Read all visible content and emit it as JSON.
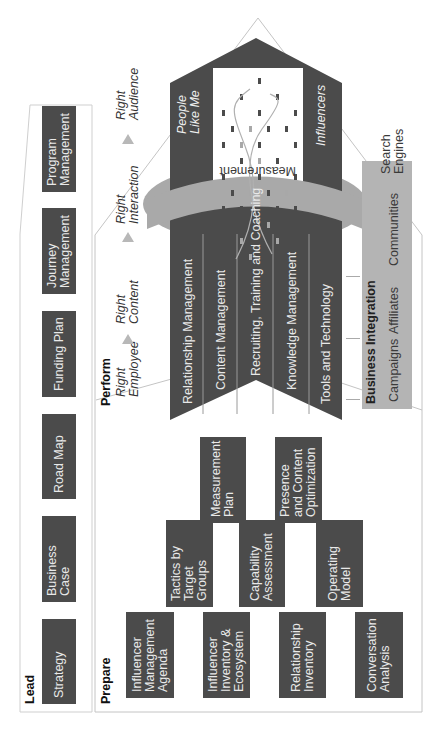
{
  "orientation": "rotated-90-ccw",
  "lead": {
    "title": "Lead",
    "items": [
      {
        "label": "Strategy"
      },
      {
        "label": "Business\nCase"
      },
      {
        "label": "Road Map"
      },
      {
        "label": "Funding Plan"
      },
      {
        "label": "Journey\nManagement"
      },
      {
        "label": "Program\nManagement"
      }
    ]
  },
  "prepare": {
    "title": "Prepare",
    "row1": [
      {
        "label": "Influencer\nManagement\nAgenda"
      },
      {
        "label": "Influencer\nInventory &\nEcosystem"
      },
      {
        "label": "Relationship\nInventory"
      },
      {
        "label": "Conversation\nAnalysis"
      }
    ],
    "row2": [
      {
        "label": "Tactics by\nTarget\nGroups"
      },
      {
        "label": "Capability\nAssessment"
      },
      {
        "label": "Operating\nModel"
      }
    ],
    "row3": [
      {
        "label": "Measurement\nPlan"
      },
      {
        "label": "Presence\nand Content\nOptimization"
      }
    ]
  },
  "perform": {
    "title": "Perform",
    "flow": [
      {
        "label": "Right\nEmployee"
      },
      {
        "label": "Right\nContent"
      },
      {
        "label": "Right\nInteraction"
      },
      {
        "label": "Right\nAudience"
      }
    ],
    "capabilities": [
      {
        "label": "Relationship Management"
      },
      {
        "label": "Content Management"
      },
      {
        "label": "Recruiting, Training and Coaching"
      },
      {
        "label": "Knowledge Management"
      },
      {
        "label": "Tools and Technology"
      }
    ],
    "measurement_ring": "Measurement",
    "audience": {
      "left_label": "People\nLike Me",
      "right_label": "Influencers"
    },
    "business_integration": {
      "title": "Business Integration",
      "items": [
        {
          "label": "Campaigns"
        },
        {
          "label": "Affiliates"
        },
        {
          "label": "Communities"
        },
        {
          "label": "Search\nEngines"
        }
      ]
    }
  },
  "colors": {
    "dark_box": "#4b4b4b",
    "ring": "#a9a9a9",
    "business_panel": "#b4b4b4",
    "outline": "#c8c8c8"
  }
}
